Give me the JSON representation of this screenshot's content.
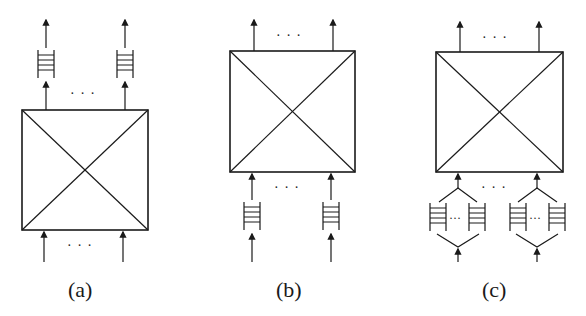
{
  "figure": {
    "panels": [
      {
        "id": "a",
        "label": "(a)",
        "queue_position": "output",
        "description": "Output-queued switch"
      },
      {
        "id": "b",
        "label": "(b)",
        "queue_position": "input",
        "description": "Input-queued switch"
      },
      {
        "id": "c",
        "label": "(c)",
        "queue_position": "virtual-output",
        "description": "Input-queued switch with virtual output queues"
      }
    ],
    "ellipsis": "· · ·",
    "inner_ellipsis": "···",
    "colors": {
      "stroke": "#1a1a1a",
      "background": "#ffffff"
    }
  }
}
